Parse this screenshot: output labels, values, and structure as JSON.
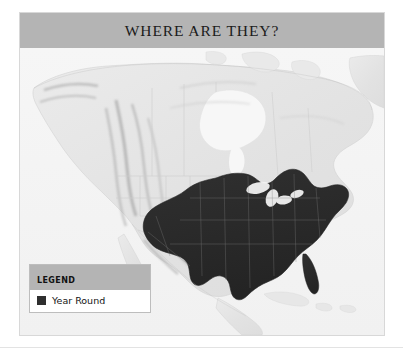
{
  "figure": {
    "title": "WHERE ARE THEY?",
    "frame_border_color": "#d8d8d8",
    "title_bar_color": "#b4b4b4"
  },
  "map": {
    "projection_region": "North America",
    "basemap_style": "grayscale shaded relief",
    "ocean_color": "#f4f4f4",
    "land_color": "#e6e6e6",
    "relief_shadow_color": "#9a9a9a",
    "border_line_color": "#c9c9c9",
    "range_fill_color": "#2b2b2b",
    "range_description": "Year-round range covering the central and eastern United States",
    "labeled_water_bodies": [
      "Hudson Bay",
      "Gulf of Mexico",
      "Great Lakes"
    ]
  },
  "legend": {
    "header": "LEGEND",
    "items": [
      {
        "label": "Year Round",
        "color": "#2f2f2f",
        "swatch": "filled-square"
      }
    ]
  }
}
